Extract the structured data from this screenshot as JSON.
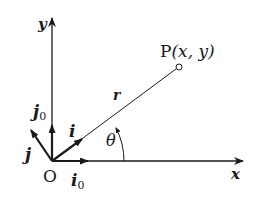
{
  "diagram": {
    "title": "",
    "axes": {
      "x_label": "x",
      "y_label": "y",
      "origin_label": "O"
    },
    "point": {
      "name": "P",
      "label_prefix": "P",
      "label_coords": "(x, y)"
    },
    "radius_label": "r",
    "angle_label": "θ",
    "vectors": {
      "i0": {
        "symbol": "i",
        "subscript": "0"
      },
      "j0": {
        "symbol": "j",
        "subscript": "0"
      },
      "i": {
        "symbol": "i"
      },
      "j": {
        "symbol": "j"
      }
    },
    "colors": {
      "stroke": "#1a1a1a",
      "background": "#ffffff"
    }
  }
}
